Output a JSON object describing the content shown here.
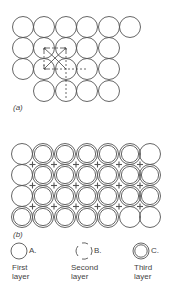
{
  "figure": {
    "part_a": {
      "label": "(a)",
      "rows": [
        {
          "y": 27,
          "xs": [
            23,
            44,
            66,
            87,
            109,
            130
          ]
        },
        {
          "y": 48,
          "xs": [
            23,
            44,
            66,
            87,
            109
          ]
        },
        {
          "y": 69,
          "xs": [
            23,
            44,
            66,
            87,
            109
          ]
        },
        {
          "y": 91,
          "xs": [
            44,
            66,
            87,
            109
          ]
        }
      ]
    },
    "part_b": {
      "label": "(b)",
      "row_y": [
        154,
        175,
        196,
        217
      ],
      "col_x": [
        22,
        43,
        65,
        87,
        108,
        130,
        150
      ],
      "layers": [
        [
          "first",
          "third",
          "third",
          "third",
          "third",
          "third",
          "first"
        ],
        [
          "first",
          "third",
          "third",
          "third",
          "third",
          "third",
          "third"
        ],
        [
          "first",
          "third",
          "third",
          "third",
          "third",
          "third",
          "third"
        ],
        [
          "third",
          "third",
          "third",
          "third",
          "third",
          "first",
          "first"
        ]
      ]
    },
    "legend": [
      {
        "letter": "A.",
        "line1": "First",
        "line2": "layer",
        "style": "solid"
      },
      {
        "letter": "B.",
        "line1": "Second",
        "line2": "layer",
        "style": "broken"
      },
      {
        "letter": "C.",
        "line1": "Third",
        "line2": "layer",
        "style": "double"
      }
    ]
  }
}
